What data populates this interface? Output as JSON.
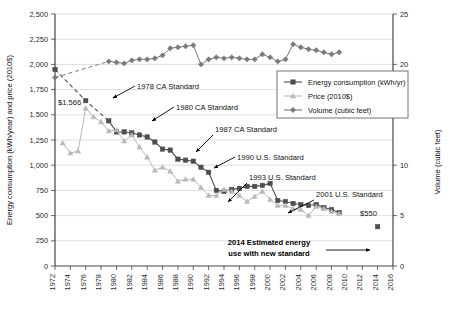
{
  "chart_data": {
    "type": "line",
    "title": "",
    "xlabel": "",
    "ylabel": "Energy consumption (kWh/year) and price (2010$)",
    "y2label": "Volume (cubic feet)",
    "xlim": [
      1972,
      2016
    ],
    "ylim": [
      0,
      2500
    ],
    "y2lim": [
      0,
      25
    ],
    "grid": true,
    "legend_position": "upper-right-inside",
    "xticks": [
      1972,
      1974,
      1976,
      1978,
      1980,
      1982,
      1984,
      1986,
      1988,
      1990,
      1992,
      1994,
      1996,
      1998,
      2000,
      2002,
      2004,
      2006,
      2008,
      2010,
      2012,
      2014,
      2016
    ],
    "yticks": [
      0,
      250,
      500,
      750,
      1000,
      1250,
      1500,
      1750,
      2000,
      2250,
      2500
    ],
    "ytick_labels": [
      "0",
      "250",
      "500",
      "750",
      "1,000",
      "1,250",
      "1,500",
      "1,750",
      "2,000",
      "2,250",
      "2,500"
    ],
    "y2ticks": [
      0,
      5,
      10,
      15,
      20,
      25
    ],
    "y2tick_labels": [
      "0",
      "5",
      "10",
      "15",
      "20",
      "25"
    ],
    "series": [
      {
        "name": "Energy consumption (kWh/yr)",
        "axis": "left",
        "color": "#4d4d4d",
        "marker": "square",
        "x": [
          1972,
          1976,
          1979,
          1980,
          1981,
          1982,
          1983,
          1984,
          1985,
          1986,
          1987,
          1988,
          1989,
          1990,
          1991,
          1992,
          1993,
          1994,
          1995,
          1996,
          1997,
          1998,
          1999,
          2000,
          2001,
          2002,
          2003,
          2004,
          2005,
          2006,
          2007,
          2008,
          2009,
          2014
        ],
        "values": [
          1950,
          1640,
          1440,
          1330,
          1330,
          1320,
          1300,
          1280,
          1230,
          1160,
          1150,
          1060,
          1050,
          1040,
          980,
          930,
          750,
          740,
          760,
          770,
          790,
          790,
          800,
          820,
          650,
          640,
          620,
          610,
          600,
          610,
          580,
          560,
          530,
          390
        ]
      },
      {
        "name": "Price (2010$)",
        "axis": "left",
        "color": "#b8b8b8",
        "marker": "triangle",
        "x": [
          1973,
          1974,
          1975,
          1976,
          1977,
          1978,
          1979,
          1980,
          1981,
          1982,
          1983,
          1984,
          1985,
          1986,
          1987,
          1988,
          1989,
          1990,
          1991,
          1992,
          1993,
          1994,
          1995,
          1996,
          1997,
          1998,
          1999,
          2000,
          2001,
          2002,
          2003,
          2004,
          2005,
          2006,
          2007,
          2008,
          2009
        ],
        "values": [
          1220,
          1120,
          1140,
          1566,
          1480,
          1430,
          1340,
          1350,
          1240,
          1300,
          1180,
          1080,
          950,
          980,
          940,
          840,
          860,
          860,
          780,
          700,
          700,
          760,
          740,
          700,
          640,
          690,
          740,
          660,
          600,
          600,
          570,
          560,
          500,
          590,
          570,
          540,
          520
        ]
      },
      {
        "name": "Volume (cubic feet)",
        "axis": "right",
        "color": "#7a7a7a",
        "marker": "diamond",
        "x": [
          1972,
          1979,
          1980,
          1981,
          1982,
          1983,
          1984,
          1985,
          1986,
          1987,
          1988,
          1989,
          1990,
          1991,
          1992,
          1993,
          1994,
          1995,
          1996,
          1997,
          1998,
          1999,
          2000,
          2001,
          2002,
          2003,
          2004,
          2005,
          2006,
          2007,
          2008,
          2009
        ],
        "values": [
          18.7,
          20.3,
          20.2,
          20.1,
          20.4,
          20.5,
          20.5,
          20.6,
          20.9,
          21.6,
          21.7,
          21.8,
          21.9,
          20.0,
          20.5,
          20.7,
          20.6,
          20.7,
          20.6,
          20.5,
          20.5,
          21.0,
          20.7,
          20.3,
          20.5,
          22.0,
          21.7,
          21.5,
          21.4,
          21.2,
          21.0,
          21.2
        ]
      }
    ],
    "annotations": [
      {
        "label": "1978 CA Standard",
        "x": 1978
      },
      {
        "label": "1980 CA Standard",
        "x": 1980
      },
      {
        "label": "1987 CA Standard",
        "x": 1987
      },
      {
        "label": "1990 U.S. Standard",
        "x": 1990
      },
      {
        "label": "1993 U.S. Standard",
        "x": 1993
      },
      {
        "label": "2001 U.S. Standard",
        "x": 2001
      },
      {
        "label": "2014 Estimated energy use with new standard",
        "x": 2014
      },
      {
        "label": "$1,566",
        "x": 1976,
        "y": 1566
      },
      {
        "label": "$550",
        "x": 2008,
        "y": 550
      }
    ],
    "annotation_lines": {
      "bold_note_line1": "2014 Estimated energy",
      "bold_note_line2": "use with new standard"
    }
  },
  "legend": {
    "entries": [
      {
        "label": "Energy consumption (kWh/yr)"
      },
      {
        "label": "Price (2010$)"
      },
      {
        "label": "Volume (cubic feet)"
      }
    ]
  },
  "axes": {
    "left_title": "Energy consumption (kWh/year) and price (2010$)",
    "right_title": "Volume (cubic feet)"
  }
}
